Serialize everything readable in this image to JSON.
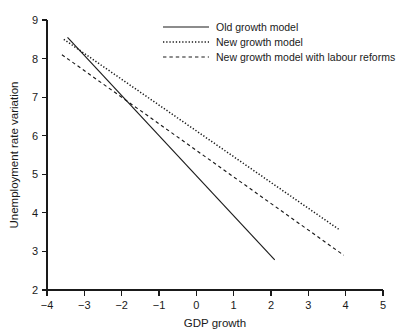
{
  "chart_data": {
    "type": "line",
    "title": "",
    "xlabel": "GDP growth",
    "ylabel": "Unemployment rate variation",
    "xlim": [
      -4,
      5
    ],
    "ylim": [
      2,
      9
    ],
    "xticks": [
      -4,
      -3,
      -2,
      -1,
      0,
      1,
      2,
      3,
      4,
      5
    ],
    "xtick_labels": [
      "−4",
      "−3",
      "−2",
      "−1",
      "0",
      "1",
      "2",
      "3",
      "4",
      "5"
    ],
    "yticks": [
      2,
      3,
      4,
      5,
      6,
      7,
      8,
      9
    ],
    "ytick_labels": [
      "2",
      "3",
      "4",
      "5",
      "6",
      "7",
      "8",
      "9"
    ],
    "grid": false,
    "legend_position": "top-center",
    "series": [
      {
        "name": "Old growth model",
        "style": "solid",
        "x": [
          -3.45,
          2.1
        ],
        "y": [
          8.55,
          2.78
        ],
        "slope": -1.04,
        "intercept": 4.97
      },
      {
        "name": "New growth model",
        "style": "dotted",
        "x": [
          -3.55,
          3.85
        ],
        "y": [
          8.5,
          3.55
        ],
        "slope": -0.669,
        "intercept": 6.125
      },
      {
        "name": "New growth model with labour reforms",
        "style": "dashed",
        "x": [
          -3.6,
          3.95
        ],
        "y": [
          8.1,
          2.9
        ],
        "slope": -0.689,
        "intercept": 5.62
      }
    ]
  },
  "legend": {
    "entries": [
      {
        "label": "Old growth model",
        "style": "solid"
      },
      {
        "label": "New growth model",
        "style": "dotted"
      },
      {
        "label": "New growth model with labour reforms",
        "style": "dashed"
      }
    ]
  },
  "colors": {
    "ink": "#1a1a1a",
    "background": "#ffffff"
  }
}
